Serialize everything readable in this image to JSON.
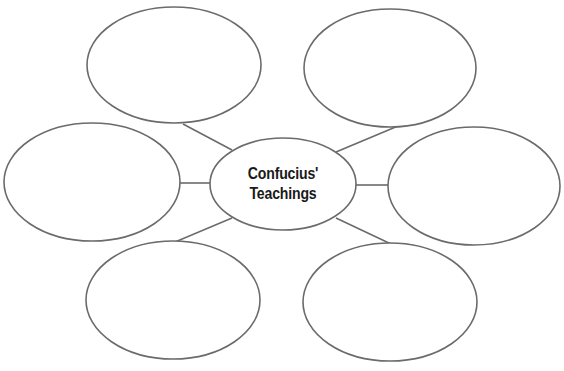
{
  "diagram": {
    "type": "web-organizer",
    "stroke_color": "#6b6b6b",
    "background": "#ffffff",
    "center": {
      "line1": "Confucius'",
      "line2": "Teachings",
      "cx": 283,
      "cy": 184,
      "rx": 73,
      "ry": 46
    },
    "nodes": [
      {
        "id": "top-left",
        "label": "",
        "cx": 174,
        "cy": 65,
        "rx": 87,
        "ry": 58
      },
      {
        "id": "top-right",
        "label": "",
        "cx": 390,
        "cy": 68,
        "rx": 86,
        "ry": 59
      },
      {
        "id": "left",
        "label": "",
        "cx": 92,
        "cy": 182,
        "rx": 88,
        "ry": 59
      },
      {
        "id": "right",
        "label": "",
        "cx": 474,
        "cy": 186,
        "rx": 86,
        "ry": 59
      },
      {
        "id": "bottom-left",
        "label": "",
        "cx": 173,
        "cy": 300,
        "rx": 87,
        "ry": 59
      },
      {
        "id": "bottom-right",
        "label": "",
        "cx": 390,
        "cy": 302,
        "rx": 87,
        "ry": 59
      }
    ],
    "connectors": [
      {
        "to": "top-left",
        "x1": 232,
        "y1": 150,
        "x2": 183,
        "y2": 124
      },
      {
        "to": "top-right",
        "x1": 336,
        "y1": 152,
        "x2": 398,
        "y2": 126
      },
      {
        "to": "left",
        "x1": 210,
        "y1": 183,
        "x2": 179,
        "y2": 183
      },
      {
        "to": "right",
        "x1": 356,
        "y1": 185,
        "x2": 388,
        "y2": 185
      },
      {
        "to": "bottom-left",
        "x1": 232,
        "y1": 218,
        "x2": 175,
        "y2": 242
      },
      {
        "to": "bottom-right",
        "x1": 336,
        "y1": 218,
        "x2": 391,
        "y2": 244
      }
    ]
  }
}
